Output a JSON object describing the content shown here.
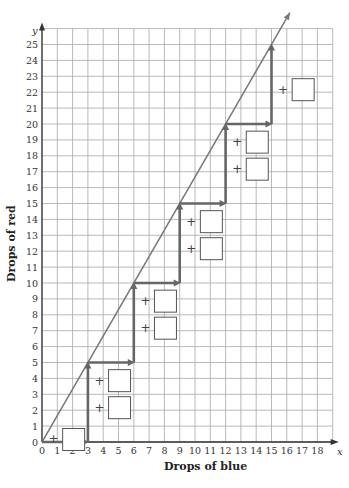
{
  "chart_data": {
    "type": "line",
    "title": "",
    "xlabel": "Drops of blue",
    "ylabel": "Drops of red",
    "x_axis_variable": "x",
    "y_axis_variable": "y",
    "xlim": [
      0,
      19
    ],
    "ylim": [
      0,
      26
    ],
    "grid": true,
    "x_ticks": [
      "0",
      "1",
      "2",
      "3",
      "4",
      "5",
      "6",
      "7",
      "8",
      "9",
      "10",
      "11",
      "12",
      "13",
      "14",
      "15",
      "16",
      "17",
      "18"
    ],
    "y_ticks": [
      "0",
      "1",
      "2",
      "3",
      "4",
      "5",
      "6",
      "7",
      "8",
      "9",
      "10",
      "11",
      "12",
      "13",
      "14",
      "15",
      "16",
      "17",
      "18",
      "19",
      "20",
      "21",
      "22",
      "23",
      "24",
      "25"
    ],
    "series": [
      {
        "name": "ratio line",
        "kind": "line",
        "points": [
          [
            0,
            0
          ],
          [
            16.2,
            27
          ]
        ],
        "color": "#777777"
      },
      {
        "name": "staircase",
        "kind": "arrows",
        "points": [
          [
            0,
            0
          ],
          [
            3,
            0
          ],
          [
            3,
            5
          ],
          [
            6,
            5
          ],
          [
            6,
            10
          ],
          [
            9,
            10
          ],
          [
            9,
            15
          ],
          [
            12,
            15
          ],
          [
            12,
            20
          ],
          [
            15,
            20
          ],
          [
            15,
            25
          ]
        ],
        "color": "#666666"
      }
    ],
    "answer_boxes": [
      {
        "label": "+",
        "x": 1,
        "y": 0.5
      },
      {
        "label": "+",
        "x": 4,
        "y": 2.5
      },
      {
        "label": "+",
        "x": 4,
        "y": 4.2
      },
      {
        "label": "+",
        "x": 7,
        "y": 7.5
      },
      {
        "label": "+",
        "x": 7,
        "y": 9.2
      },
      {
        "label": "+",
        "x": 10,
        "y": 12.5
      },
      {
        "label": "+",
        "x": 10,
        "y": 14.2
      },
      {
        "label": "+",
        "x": 13,
        "y": 17.5
      },
      {
        "label": "+",
        "x": 13,
        "y": 19.2
      },
      {
        "label": "+",
        "x": 16,
        "y": 22.5
      }
    ]
  },
  "labels": {
    "x_title": "Drops of blue",
    "y_title": "Drops of red",
    "x_var": "x",
    "y_var": "y",
    "plus": "+"
  }
}
